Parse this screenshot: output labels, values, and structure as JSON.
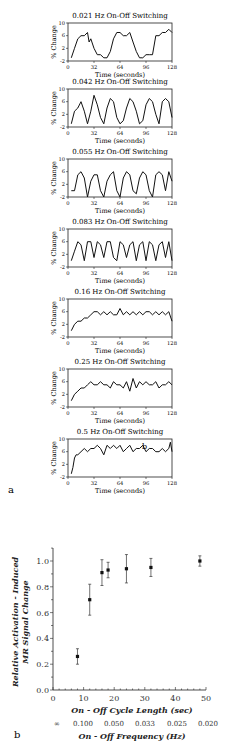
{
  "figure": {
    "panel_a_label": "a",
    "panel_b_label": "b",
    "stray_mark": "b"
  },
  "panel_a": {
    "ylabel": "% Change",
    "xlabel": "Time  (seconds)",
    "yticks": [
      "10",
      "6",
      "2",
      "-2"
    ],
    "xticks": [
      "0",
      "32",
      "64",
      "96",
      "128"
    ],
    "panels": [
      {
        "title": "0.021 Hz On-Off Switching"
      },
      {
        "title": "0.042 Hz On-Off Switching"
      },
      {
        "title": "0.055 Hz On-Off Switching"
      },
      {
        "title": "0.083 Hz On-Off Switching"
      },
      {
        "title": "0.16 Hz On-Off Switching"
      },
      {
        "title": "0.25 Hz On-Off Switching"
      },
      {
        "title": "0.5 Hz On-Off Switching"
      }
    ]
  },
  "panel_b": {
    "ylabel_line1": "Relative Activation - Induced",
    "ylabel_line2": "MR Signal Change",
    "xlabel": "On - Off Cycle Length (sec)",
    "x2label": "On - Off Frequency (Hz)",
    "yticks": [
      "0.0",
      "0.2",
      "0.4",
      "0.6",
      "0.8",
      "1.0"
    ],
    "xticks": [
      "0",
      "10",
      "20",
      "30",
      "40",
      "50"
    ],
    "x2ticks": [
      "∞",
      "0.100",
      "0.050",
      "0.033",
      "0.025",
      "0.020"
    ]
  },
  "chart_data": [
    {
      "type": "line",
      "title": "0.021 Hz On-Off Switching",
      "xlabel": "Time (seconds)",
      "ylabel": "% Change",
      "xlim": [
        0,
        128
      ],
      "ylim": [
        -2,
        10
      ],
      "x": [
        4,
        8,
        12,
        16,
        20,
        24,
        26,
        28,
        32,
        36,
        40,
        44,
        48,
        52,
        56,
        60,
        64,
        68,
        72,
        76,
        80,
        84,
        88,
        92,
        96,
        100,
        104,
        108,
        112,
        116,
        120,
        124,
        128
      ],
      "values": [
        -1,
        2,
        5,
        6,
        6,
        7,
        4,
        5,
        2,
        0,
        0,
        -1,
        -1,
        1,
        5,
        7,
        7,
        6,
        6,
        7,
        4,
        1,
        -1,
        -1,
        0,
        0,
        0,
        6,
        6,
        7,
        7,
        8,
        7
      ]
    },
    {
      "type": "line",
      "title": "0.042 Hz On-Off Switching",
      "xlabel": "Time (seconds)",
      "ylabel": "% Change",
      "xlim": [
        0,
        128
      ],
      "ylim": [
        -2,
        10
      ],
      "x": [
        4,
        8,
        12,
        16,
        20,
        24,
        28,
        32,
        36,
        40,
        44,
        48,
        52,
        56,
        60,
        64,
        68,
        72,
        76,
        80,
        84,
        88,
        92,
        96,
        100,
        104,
        108,
        112,
        116,
        120,
        124,
        128
      ],
      "values": [
        -1,
        3,
        4,
        6,
        3,
        -1,
        3,
        8,
        5,
        1,
        -1,
        4,
        7,
        6,
        1,
        -1,
        0,
        4,
        7,
        6,
        3,
        -1,
        0,
        5,
        7,
        6,
        2,
        -1,
        6,
        7,
        6,
        1
      ]
    },
    {
      "type": "line",
      "title": "0.055 Hz On-Off Switching",
      "xlabel": "Time (seconds)",
      "ylabel": "% Change",
      "xlim": [
        0,
        128
      ],
      "ylim": [
        -2,
        10
      ],
      "x": [
        4,
        8,
        12,
        16,
        20,
        24,
        28,
        32,
        36,
        40,
        44,
        48,
        52,
        56,
        60,
        64,
        68,
        72,
        76,
        80,
        84,
        88,
        92,
        96,
        100,
        104,
        108,
        112,
        116,
        120,
        124,
        128
      ],
      "values": [
        0,
        0,
        5,
        6,
        4,
        -2,
        3,
        5,
        5,
        0,
        -2,
        3,
        5,
        6,
        0,
        -2,
        4,
        6,
        5,
        0,
        -1,
        4,
        6,
        5,
        0,
        -2,
        5,
        6,
        5,
        0,
        6,
        3
      ]
    },
    {
      "type": "line",
      "title": "0.083 Hz On-Off Switching",
      "xlabel": "Time (seconds)",
      "ylabel": "% Change",
      "xlim": [
        0,
        128
      ],
      "ylim": [
        -2,
        10
      ],
      "x": [
        4,
        8,
        12,
        16,
        20,
        24,
        28,
        32,
        36,
        40,
        44,
        48,
        52,
        56,
        60,
        64,
        68,
        72,
        76,
        80,
        84,
        88,
        92,
        96,
        100,
        104,
        108,
        112,
        116,
        120,
        124,
        128
      ],
      "values": [
        0,
        3,
        6,
        5,
        0,
        6,
        6,
        1,
        6,
        5,
        1,
        6,
        6,
        1,
        0,
        6,
        5,
        1,
        5,
        6,
        0,
        5,
        6,
        0,
        6,
        5,
        0,
        5,
        6,
        1,
        6,
        0
      ]
    },
    {
      "type": "line",
      "title": "0.16 Hz On-Off Switching",
      "xlabel": "Time (seconds)",
      "ylabel": "% Change",
      "xlim": [
        0,
        128
      ],
      "ylim": [
        -2,
        10
      ],
      "x": [
        4,
        8,
        12,
        16,
        20,
        24,
        28,
        32,
        36,
        40,
        44,
        48,
        52,
        56,
        60,
        64,
        68,
        72,
        76,
        80,
        84,
        88,
        92,
        96,
        100,
        104,
        108,
        112,
        116,
        120,
        124,
        128
      ],
      "values": [
        0,
        2,
        3,
        3,
        4,
        4,
        5,
        6,
        6,
        5,
        6,
        5,
        6,
        5,
        5,
        7,
        5,
        6,
        5,
        6,
        5,
        6,
        5,
        6,
        6,
        5,
        6,
        5,
        6,
        5,
        6,
        3
      ]
    },
    {
      "type": "line",
      "title": "0.25 Hz On-Off Switching",
      "xlabel": "Time (seconds)",
      "ylabel": "% Change",
      "xlim": [
        0,
        128
      ],
      "ylim": [
        -2,
        10
      ],
      "x": [
        4,
        8,
        12,
        16,
        20,
        24,
        28,
        32,
        36,
        40,
        44,
        48,
        52,
        56,
        60,
        64,
        68,
        72,
        76,
        80,
        84,
        88,
        92,
        96,
        100,
        104,
        108,
        112,
        116,
        120,
        124,
        128
      ],
      "values": [
        0,
        2,
        3,
        4,
        4,
        5,
        6,
        5,
        5,
        6,
        5,
        5,
        4,
        6,
        5,
        5,
        4,
        6,
        3,
        7,
        4,
        6,
        5,
        6,
        5,
        5,
        6,
        4,
        5,
        5,
        6,
        5
      ]
    },
    {
      "type": "line",
      "title": "0.5 Hz On-Off Switching",
      "xlabel": "Time (seconds)",
      "ylabel": "% Change",
      "xlim": [
        0,
        128
      ],
      "ylim": [
        -2,
        10
      ],
      "x": [
        4,
        6,
        8,
        10,
        12,
        16,
        20,
        24,
        28,
        32,
        36,
        40,
        44,
        48,
        52,
        56,
        60,
        64,
        68,
        72,
        76,
        80,
        84,
        88,
        92,
        96,
        100,
        104,
        108,
        112,
        116,
        120,
        124,
        126,
        128
      ],
      "values": [
        -1,
        1,
        4,
        5,
        5,
        6,
        7,
        6,
        7,
        7,
        8,
        7,
        5,
        8,
        7,
        8,
        7,
        8,
        6,
        7,
        8,
        6,
        7,
        7,
        8,
        6,
        7,
        7,
        6,
        6,
        7,
        6,
        7,
        9,
        6
      ]
    },
    {
      "type": "scatter",
      "title": "",
      "xlabel": "On - Off Cycle Length (sec)",
      "ylabel": "Relative Activation - Induced MR Signal Change",
      "secondary_xlabel": "On - Off Frequency (Hz)",
      "secondary_xticks": [
        "∞",
        "0.100",
        "0.050",
        "0.033",
        "0.025",
        "0.020"
      ],
      "xlim": [
        0,
        50
      ],
      "ylim": [
        0,
        1.1
      ],
      "x": [
        8,
        12,
        16,
        18,
        24,
        32,
        48
      ],
      "values": [
        0.26,
        0.7,
        0.91,
        0.93,
        0.94,
        0.95,
        1.0
      ],
      "error": [
        0.06,
        0.12,
        0.1,
        0.06,
        0.11,
        0.07,
        0.04
      ],
      "grid": false
    }
  ]
}
